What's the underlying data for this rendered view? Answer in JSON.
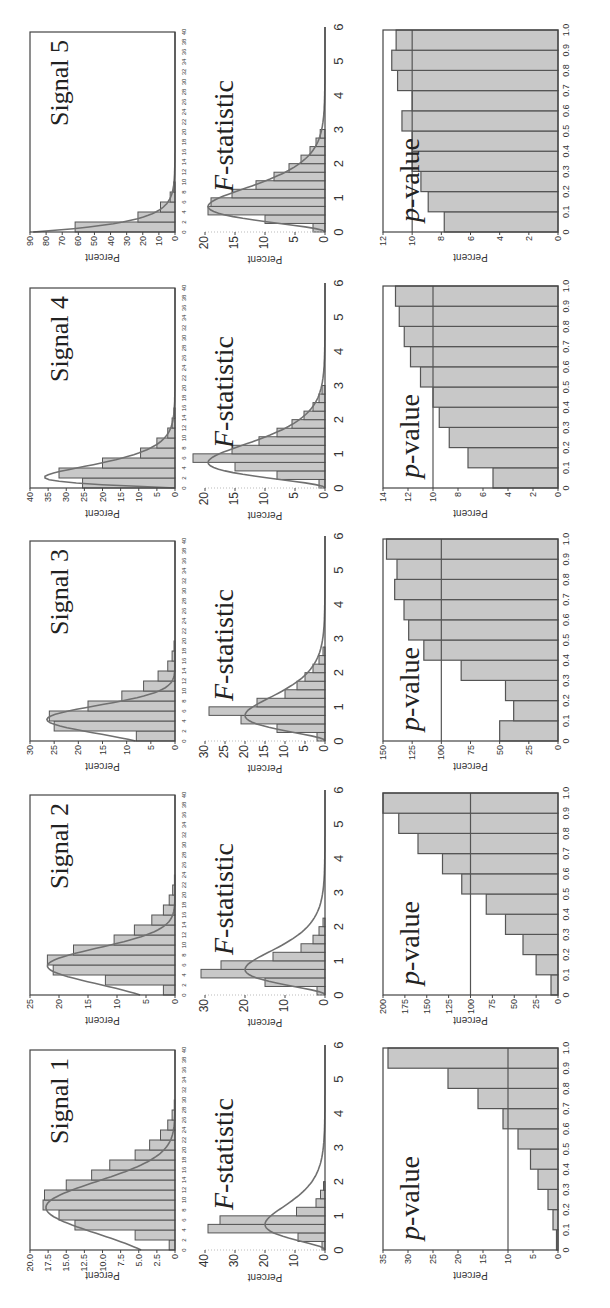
{
  "figure": {
    "orientation": "rotated -90 degrees (landscape figure on portrait page)",
    "ylabel": "Percent",
    "row_titles": {
      "statistic": "F-statistic",
      "pvalue": "p-value"
    }
  },
  "colors": {
    "bar_fill": "#c8c8c8",
    "bar_edge": "#555555",
    "curve": "#707070",
    "axis": "#444444",
    "ref_line": "#555555"
  },
  "chart_data": [
    {
      "type": "bar",
      "panel": "signal",
      "title": "Signal 1",
      "xlabel": "",
      "ylabel": "Percent",
      "xlim": [
        0,
        40
      ],
      "ylim": [
        0,
        20
      ],
      "xticks": [
        0,
        2,
        4,
        6,
        8,
        10,
        12,
        14,
        16,
        18,
        20,
        22,
        24,
        26,
        28,
        30,
        32,
        34,
        36,
        38,
        40
      ],
      "yticks": [
        "0",
        "2.5",
        "5.0",
        "7.5",
        "10.0",
        "12.5",
        "15.0",
        "17.5",
        "20.0"
      ],
      "bin_width": 2,
      "x": [
        0,
        2,
        4,
        6,
        8,
        10,
        12,
        14,
        16,
        18,
        20,
        22,
        24,
        26,
        28
      ],
      "values": [
        0.8,
        5.5,
        13.8,
        16.0,
        18.2,
        18.0,
        15.0,
        11.5,
        9.0,
        5.5,
        3.5,
        2.0,
        1.0,
        0.4,
        0.1
      ],
      "fit_curve": "normal",
      "fit_peak": 17.8,
      "fit_mode": 8.5,
      "fit_sd": 5.2
    },
    {
      "type": "bar",
      "panel": "signal",
      "title": "Signal 2",
      "xlabel": "",
      "ylabel": "Percent",
      "xlim": [
        0,
        40
      ],
      "ylim": [
        0,
        25
      ],
      "xticks": [
        0,
        2,
        4,
        6,
        8,
        10,
        12,
        14,
        16,
        18,
        20,
        22,
        24,
        26,
        28,
        30,
        32,
        34,
        36,
        38,
        40
      ],
      "yticks": [
        "0",
        "5",
        "10",
        "15",
        "20",
        "25"
      ],
      "bin_width": 2,
      "x": [
        0,
        2,
        4,
        6,
        8,
        10,
        12,
        14,
        16,
        18,
        20,
        22
      ],
      "values": [
        2.0,
        12.0,
        21.0,
        22.0,
        17.5,
        10.5,
        7.0,
        4.0,
        2.0,
        1.0,
        0.4,
        0.1
      ],
      "fit_curve": "normal",
      "fit_peak": 22.0,
      "fit_mode": 5.8,
      "fit_sd": 3.6
    },
    {
      "type": "bar",
      "panel": "signal",
      "title": "Signal 3",
      "xlabel": "",
      "ylabel": "Percent",
      "xlim": [
        0,
        40
      ],
      "ylim": [
        0,
        30
      ],
      "xticks": [
        0,
        2,
        4,
        6,
        8,
        10,
        12,
        14,
        16,
        18,
        20,
        22,
        24,
        26,
        28,
        30,
        32,
        34,
        36,
        38,
        40
      ],
      "yticks": [
        "0",
        "5",
        "10",
        "15",
        "20",
        "25",
        "30"
      ],
      "bin_width": 2,
      "x": [
        0,
        2,
        4,
        6,
        8,
        10,
        12,
        14,
        16,
        18
      ],
      "values": [
        8.0,
        25.0,
        26.0,
        18.0,
        11.0,
        6.5,
        3.5,
        1.5,
        0.6,
        0.2
      ],
      "fit_curve": "normal",
      "fit_peak": 26.5,
      "fit_mode": 4.3,
      "fit_sd": 2.8
    },
    {
      "type": "bar",
      "panel": "signal",
      "title": "Signal 4",
      "xlabel": "",
      "ylabel": "Percent",
      "xlim": [
        0,
        40
      ],
      "ylim": [
        0,
        40
      ],
      "xticks": [
        0,
        2,
        4,
        6,
        8,
        10,
        12,
        14,
        16,
        18,
        20,
        22,
        24,
        26,
        28,
        30,
        32,
        34,
        36,
        38,
        40
      ],
      "yticks": [
        "0",
        "5",
        "10",
        "15",
        "20",
        "25",
        "30",
        "35",
        "40"
      ],
      "bin_width": 2,
      "x": [
        0,
        2,
        4,
        6,
        8,
        10,
        12,
        14
      ],
      "values": [
        25.5,
        32.0,
        20.0,
        9.5,
        5.0,
        2.0,
        0.8,
        0.3
      ],
      "fit_curve": "skewed",
      "fit_peak": 36.0,
      "fit_mode": 2.2,
      "fit_sd": 2.5
    },
    {
      "type": "bar",
      "panel": "signal",
      "title": "Signal 5",
      "xlabel": "",
      "ylabel": "Percent",
      "xlim": [
        0,
        40
      ],
      "ylim": [
        0,
        90
      ],
      "xticks": [
        0,
        2,
        4,
        6,
        8,
        10,
        12,
        14,
        16,
        18,
        20,
        22,
        24,
        26,
        28,
        30,
        32,
        34,
        36,
        38,
        40
      ],
      "yticks": [
        "0",
        "10",
        "20",
        "30",
        "40",
        "50",
        "60",
        "70",
        "80",
        "90"
      ],
      "bin_width": 2,
      "x": [
        0,
        2,
        4,
        6,
        8
      ],
      "values": [
        62.0,
        23.0,
        9.0,
        3.0,
        0.8
      ],
      "fit_curve": "exponential",
      "fit_peak": 88.0,
      "fit_mode": 0.0,
      "fit_sd": 2.0
    },
    {
      "type": "bar",
      "panel": "statistic",
      "title": "F-statistic",
      "xlabel": "",
      "ylabel": "Percent",
      "xlim": [
        0,
        6
      ],
      "ylim": [
        0,
        40
      ],
      "xticks": [
        0,
        1,
        2,
        3,
        4,
        5,
        6
      ],
      "yticks": [
        "0",
        "10",
        "20",
        "30",
        "40"
      ],
      "bin_width": 0.25,
      "x": [
        0.25,
        0.5,
        0.75,
        1.0,
        1.25,
        1.5,
        1.75,
        2.0
      ],
      "values": [
        1.0,
        9.0,
        39.0,
        35.0,
        9.5,
        3.0,
        1.5,
        0.5
      ],
      "fit_curve": "F-density",
      "fit_peak": 20.0,
      "fit_mode": 0.75
    },
    {
      "type": "bar",
      "panel": "statistic",
      "title": "F-statistic",
      "xlabel": "",
      "ylabel": "Percent",
      "xlim": [
        0,
        6
      ],
      "ylim": [
        0,
        30
      ],
      "xticks": [
        0,
        1,
        2,
        3,
        4,
        5,
        6
      ],
      "yticks": [
        "0",
        "10",
        "20",
        "30"
      ],
      "bin_width": 0.25,
      "x": [
        0.25,
        0.5,
        0.75,
        1.0,
        1.25,
        1.5,
        1.75,
        2.0,
        2.25
      ],
      "values": [
        2.0,
        15.0,
        31.0,
        26.0,
        13.0,
        6.0,
        3.0,
        1.5,
        0.5
      ],
      "fit_curve": "F-density",
      "fit_peak": 20.0,
      "fit_mode": 0.8
    },
    {
      "type": "bar",
      "panel": "statistic",
      "title": "F-statistic",
      "xlabel": "",
      "ylabel": "Percent",
      "xlim": [
        0,
        6
      ],
      "ylim": [
        0,
        30
      ],
      "xticks": [
        0,
        1,
        2,
        3,
        4,
        5,
        6
      ],
      "yticks": [
        "0",
        "5",
        "10",
        "15",
        "20",
        "25",
        "30"
      ],
      "bin_width": 0.25,
      "x": [
        0.25,
        0.5,
        0.75,
        1.0,
        1.25,
        1.5,
        1.75,
        2.0,
        2.25,
        2.5,
        2.75
      ],
      "values": [
        2.0,
        12.0,
        21.0,
        29.0,
        17.0,
        10.0,
        7.0,
        5.0,
        3.0,
        1.5,
        0.5
      ],
      "fit_curve": "F-density",
      "fit_peak": 20.0,
      "fit_mode": 0.75
    },
    {
      "type": "bar",
      "panel": "statistic",
      "title": "F-statistic",
      "xlabel": "",
      "ylabel": "Percent",
      "xlim": [
        0,
        6
      ],
      "ylim": [
        0,
        20
      ],
      "xticks": [
        0,
        1,
        2,
        3,
        4,
        5,
        6
      ],
      "yticks": [
        "0",
        "5",
        "10",
        "15",
        "20"
      ],
      "bin_width": 0.25,
      "x": [
        0.25,
        0.5,
        0.75,
        1.0,
        1.25,
        1.5,
        1.75,
        2.0,
        2.25,
        2.5,
        2.75,
        3.0
      ],
      "values": [
        1.0,
        8.0,
        15.0,
        22.0,
        15.5,
        11.0,
        8.0,
        5.5,
        3.5,
        2.0,
        1.0,
        0.5
      ],
      "fit_curve": "F-density",
      "fit_peak": 19.5,
      "fit_mode": 0.8
    },
    {
      "type": "bar",
      "panel": "statistic",
      "title": "F-statistic",
      "xlabel": "",
      "ylabel": "Percent",
      "xlim": [
        0,
        6
      ],
      "ylim": [
        0,
        20
      ],
      "xticks": [
        0,
        1,
        2,
        3,
        4,
        5,
        6
      ],
      "yticks": [
        "0",
        "5",
        "10",
        "15",
        "20"
      ],
      "bin_width": 0.25,
      "x": [
        0.25,
        0.5,
        0.75,
        1.0,
        1.25,
        1.5,
        1.75,
        2.0,
        2.25,
        2.5,
        2.75,
        3.0
      ],
      "values": [
        2.0,
        10.0,
        19.5,
        19.0,
        15.5,
        11.5,
        8.5,
        6.0,
        4.0,
        2.5,
        1.5,
        0.8
      ],
      "fit_curve": "F-density",
      "fit_peak": 19.5,
      "fit_mode": 0.8
    },
    {
      "type": "bar",
      "panel": "pvalue",
      "title": "p-value",
      "xlabel": "",
      "ylabel": "Percent",
      "xlim": [
        0,
        1
      ],
      "ylim": [
        0,
        35
      ],
      "xticks": [
        "0",
        "0.1",
        "0.2",
        "0.3",
        "0.4",
        "0.5",
        "0.6",
        "0.7",
        "0.8",
        "0.9",
        "1.0"
      ],
      "yticks": [
        "0",
        "5",
        "10",
        "15",
        "20",
        "25",
        "30",
        "35"
      ],
      "bins": [
        0,
        0.1,
        0.2,
        0.3,
        0.4,
        0.5,
        0.6,
        0.7,
        0.8,
        0.9
      ],
      "values": [
        0.3,
        1.0,
        2.0,
        4.0,
        5.5,
        8.0,
        11.0,
        16.0,
        22.0,
        34.0
      ],
      "reference_line": 10
    },
    {
      "type": "bar",
      "panel": "pvalue",
      "title": "p-value",
      "xlabel": "",
      "ylabel": "Percent",
      "xlim": [
        0,
        1
      ],
      "ylim": [
        0,
        200
      ],
      "xticks": [
        "0",
        "0.1",
        "0.2",
        "0.3",
        "0.4",
        "0.5",
        "0.6",
        "0.7",
        "0.8",
        "0.9",
        "1.0"
      ],
      "yticks": [
        "0",
        "25",
        "50",
        "75",
        "100",
        "125",
        "150",
        "175",
        "200"
      ],
      "bins": [
        0,
        0.1,
        0.2,
        0.3,
        0.4,
        0.5,
        0.6,
        0.7,
        0.8,
        0.9
      ],
      "values": [
        8.0,
        25.0,
        40.0,
        60.0,
        82.0,
        110.0,
        132.0,
        160.0,
        182.0,
        200.0
      ],
      "reference_line": 100
    },
    {
      "type": "bar",
      "panel": "pvalue",
      "title": "p-value",
      "xlabel": "",
      "ylabel": "Percent",
      "xlim": [
        0,
        1
      ],
      "ylim": [
        0,
        150
      ],
      "xticks": [
        "0",
        "0.1",
        "0.2",
        "0.3",
        "0.4",
        "0.5",
        "0.6",
        "0.7",
        "0.8",
        "0.9",
        "1.0"
      ],
      "yticks": [
        "0",
        "25",
        "50",
        "75",
        "100",
        "125",
        "150"
      ],
      "bins": [
        0,
        0.1,
        0.2,
        0.3,
        0.4,
        0.5,
        0.6,
        0.7,
        0.8,
        0.9
      ],
      "values": [
        50.0,
        38.0,
        45.0,
        83.0,
        115.0,
        128.0,
        132.0,
        140.0,
        138.0,
        147.0
      ],
      "reference_line": 100
    },
    {
      "type": "bar",
      "panel": "pvalue",
      "title": "p-value",
      "xlabel": "",
      "ylabel": "Percent",
      "xlim": [
        0,
        1
      ],
      "ylim": [
        0,
        14
      ],
      "xticks": [
        "0",
        "0.1",
        "0.2",
        "0.3",
        "0.4",
        "0.5",
        "0.6",
        "0.7",
        "0.8",
        "0.9",
        "1.0"
      ],
      "yticks": [
        "0",
        "2",
        "4",
        "6",
        "8",
        "10",
        "12",
        "14"
      ],
      "bins": [
        0,
        0.1,
        0.2,
        0.3,
        0.4,
        0.5,
        0.6,
        0.7,
        0.8,
        0.9
      ],
      "values": [
        5.2,
        7.2,
        8.7,
        9.5,
        10.0,
        11.0,
        11.8,
        12.3,
        12.7,
        13.0
      ],
      "reference_line": 10
    },
    {
      "type": "bar",
      "panel": "pvalue",
      "title": "p-value",
      "xlabel": "",
      "ylabel": "Percent",
      "xlim": [
        0,
        1
      ],
      "ylim": [
        0,
        12
      ],
      "xticks": [
        "0",
        "0.1",
        "0.2",
        "0.3",
        "0.4",
        "0.5",
        "0.6",
        "0.7",
        "0.8",
        "0.9",
        "1.0"
      ],
      "yticks": [
        "0",
        "2",
        "4",
        "6",
        "8",
        "10",
        "12"
      ],
      "bins": [
        0,
        0.1,
        0.2,
        0.3,
        0.4,
        0.5,
        0.6,
        0.7,
        0.8,
        0.9
      ],
      "values": [
        7.8,
        8.9,
        9.4,
        10.0,
        10.0,
        10.7,
        10.0,
        11.0,
        11.4,
        11.1
      ],
      "reference_line": 10
    }
  ]
}
